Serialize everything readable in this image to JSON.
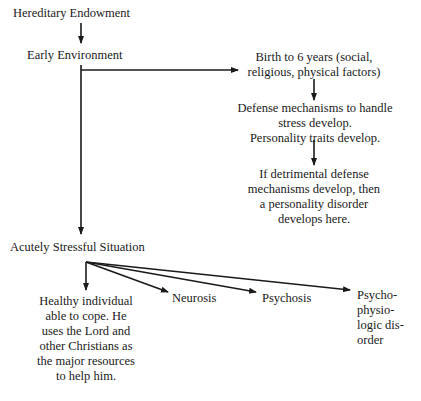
{
  "diagram": {
    "nodes": {
      "hereditary": "Hereditary Endowment",
      "early_env": "Early Environment",
      "birth": [
        "Birth to 6 years (social,",
        "religious, physical factors)"
      ],
      "defense": [
        "Defense mechanisms to handle",
        "stress develop.",
        "Personality traits develop."
      ],
      "detrimental": [
        "If detrimental defense",
        "mechanisms develop, then",
        "a personality disorder",
        "develops here."
      ],
      "acute": "Acutely Stressful Situation",
      "healthy": [
        "Healthy individual",
        "able to cope. He",
        "uses the Lord and",
        "other Christians as",
        "the major resources",
        "to help him."
      ],
      "neurosis": "Neurosis",
      "psychosis": "Psychosis",
      "psychophys": [
        "Psycho-",
        "physio-",
        "logic dis-",
        "order"
      ]
    },
    "edges": [
      {
        "from": "Hereditary Endowment",
        "to": "Early Environment"
      },
      {
        "from": "Early Environment",
        "to": "Birth to 6 years"
      },
      {
        "from": "Birth to 6 years",
        "to": "Defense mechanisms"
      },
      {
        "from": "Defense mechanisms",
        "to": "If detrimental defense mechanisms"
      },
      {
        "from": "Early Environment",
        "to": "Acutely Stressful Situation"
      },
      {
        "from": "Acutely Stressful Situation",
        "to": "Healthy individual"
      },
      {
        "from": "Acutely Stressful Situation",
        "to": "Neurosis"
      },
      {
        "from": "Acutely Stressful Situation",
        "to": "Psychosis"
      },
      {
        "from": "Acutely Stressful Situation",
        "to": "Psychophysiologic disorder"
      }
    ],
    "colors": {
      "ink": "#1a1a1a",
      "background": "#ffffff"
    }
  }
}
